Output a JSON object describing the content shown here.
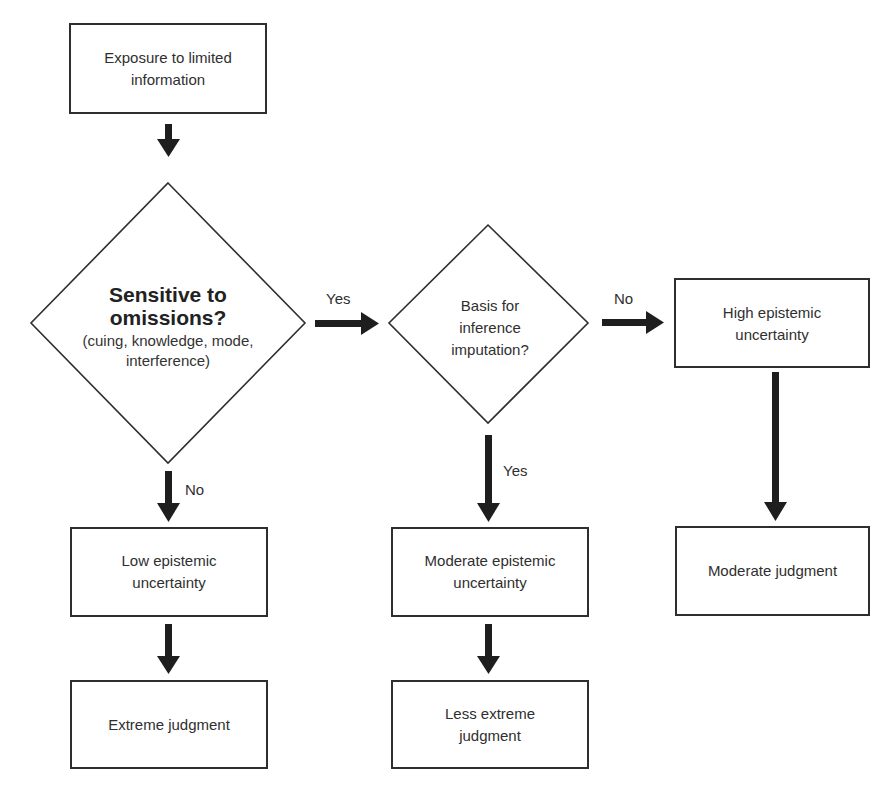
{
  "diagram": {
    "type": "flowchart",
    "nodes": {
      "exposure": {
        "label": "Exposure to limited information"
      },
      "sensitive": {
        "label": "Sensitive to omissions?",
        "sublabel": "(cuing, knowledge, mode, interference)"
      },
      "basis": {
        "label": "Basis for inference imputation?"
      },
      "high_uncertainty": {
        "label": "High epistemic uncertainty"
      },
      "low_uncertainty": {
        "label": "Low epistemic uncertainty"
      },
      "moderate_uncertainty": {
        "label": "Moderate epistemic uncertainty"
      },
      "moderate_judgment": {
        "label": "Moderate judgment"
      },
      "extreme_judgment": {
        "label": "Extreme judgment"
      },
      "less_extreme_judgment": {
        "label": "Less extreme judgment"
      }
    },
    "edges": {
      "sensitive_yes": {
        "label": "Yes"
      },
      "sensitive_no": {
        "label": "No"
      },
      "basis_no": {
        "label": "No"
      },
      "basis_yes": {
        "label": "Yes"
      }
    },
    "connections": [
      {
        "from": "exposure",
        "to": "sensitive",
        "label": ""
      },
      {
        "from": "sensitive",
        "to": "basis",
        "label": "Yes"
      },
      {
        "from": "sensitive",
        "to": "low_uncertainty",
        "label": "No"
      },
      {
        "from": "basis",
        "to": "high_uncertainty",
        "label": "No"
      },
      {
        "from": "basis",
        "to": "moderate_uncertainty",
        "label": "Yes"
      },
      {
        "from": "high_uncertainty",
        "to": "moderate_judgment",
        "label": ""
      },
      {
        "from": "low_uncertainty",
        "to": "extreme_judgment",
        "label": ""
      },
      {
        "from": "moderate_uncertainty",
        "to": "less_extreme_judgment",
        "label": ""
      }
    ],
    "colors": {
      "stroke": "#2e2e2e",
      "arrow": "#1e1e1e",
      "text": "#2f2f2f",
      "background": "#ffffff"
    }
  }
}
